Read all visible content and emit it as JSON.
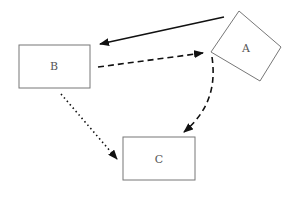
{
  "diagram": {
    "nodes": [
      {
        "id": "A",
        "label": "A"
      },
      {
        "id": "B",
        "label": "B"
      },
      {
        "id": "C",
        "label": "C"
      }
    ],
    "edges": [
      {
        "from": "A",
        "to": "B",
        "style": "solid"
      },
      {
        "from": "B",
        "to": "A",
        "style": "dashed"
      },
      {
        "from": "A",
        "to": "C",
        "style": "dashed-curved"
      },
      {
        "from": "B",
        "to": "C",
        "style": "dotted"
      }
    ],
    "colors": {
      "box_stroke": "#777777",
      "edge": "#111111",
      "label": "#555555"
    }
  }
}
